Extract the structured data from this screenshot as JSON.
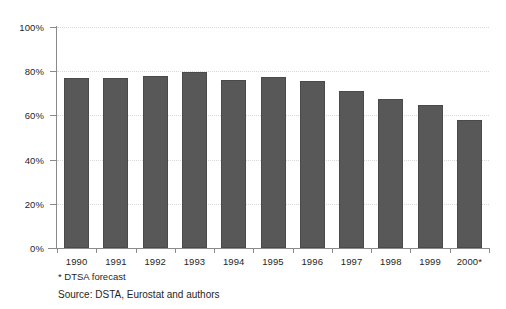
{
  "chart_data": {
    "type": "bar",
    "title": "",
    "subtitle": "",
    "xlabel": "",
    "ylabel": "",
    "categories": [
      "1990",
      "1991",
      "1992",
      "1993",
      "1994",
      "1995",
      "1996",
      "1997",
      "1998",
      "1999",
      "2000*"
    ],
    "values": [
      77,
      77,
      78,
      79.5,
      76,
      77.5,
      75.5,
      71,
      67.5,
      64.5,
      58
    ],
    "ylim": [
      0,
      100
    ],
    "ytick_labels": [
      "0%",
      "20%",
      "40%",
      "60%",
      "80%",
      "100%"
    ],
    "ytick_values": [
      0,
      20,
      40,
      60,
      80,
      100
    ],
    "grid": true,
    "legend": "none",
    "bar_color": "#585858",
    "gridline_color": "#d8d8d8",
    "axis_color": "#8a8a8a",
    "background_color": "#ffffff"
  },
  "notes": {
    "footnote": "* DTSA forecast",
    "source": "Source: DSTA, Eurostat and authors"
  }
}
